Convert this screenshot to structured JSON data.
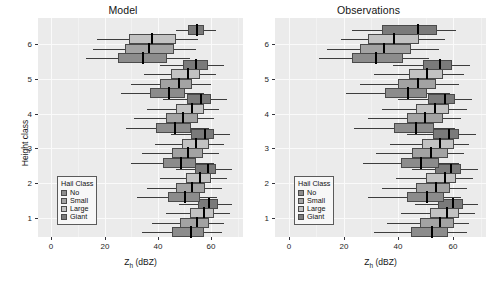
{
  "chart_data": {
    "type": "box",
    "title": "",
    "panels": [
      {
        "label": "Model",
        "key": "model"
      },
      {
        "label": "Observations",
        "key": "observations"
      }
    ],
    "xlabel": "Z_h (dBZ)",
    "xlabel_base": "Z",
    "xlabel_sub": "h",
    "xlabel_unit": " (dBZ)",
    "ylabel": "Height class",
    "xlim": [
      -5,
      72
    ],
    "xticks": [
      0,
      20,
      40,
      60
    ],
    "xtick_labels": [
      "0",
      "20",
      "40",
      "60"
    ],
    "yticks": [
      1,
      2,
      3,
      4,
      5,
      6
    ],
    "ytick_labels": [
      "1",
      "2",
      "3",
      "4",
      "5",
      "6"
    ],
    "ylim": [
      0.45,
      6.75
    ],
    "grid": true,
    "legend": {
      "title": "Hail Class",
      "position": "lower-left-inside",
      "entries": [
        {
          "label": "No",
          "color": "#8c8c8c"
        },
        {
          "label": "Small",
          "color": "#a3a3a3"
        },
        {
          "label": "Large",
          "color": "#c2c2c2"
        },
        {
          "label": "Giant",
          "color": "#7a7a7a"
        }
      ]
    },
    "series_order": [
      "No",
      "Small",
      "Large",
      "Giant"
    ],
    "boxes": {
      "model": [
        {
          "height_class": 6,
          "hail_class": "Giant",
          "whisker_low": 47.0,
          "q1": 51.5,
          "median": 54.5,
          "q3": 57.5,
          "whisker_high": 62.0
        },
        {
          "height_class": 6,
          "hail_class": "Large",
          "whisker_low": 17.0,
          "q1": 29.0,
          "median": 37.5,
          "q3": 46.5,
          "whisker_high": 55.0
        },
        {
          "height_class": 6,
          "hail_class": "Small",
          "whisker_low": 15.5,
          "q1": 27.5,
          "median": 36.5,
          "q3": 46.0,
          "whisker_high": 54.0
        },
        {
          "height_class": 6,
          "hail_class": "No",
          "whisker_low": 13.0,
          "q1": 25.0,
          "median": 34.0,
          "q3": 43.5,
          "whisker_high": 52.0
        },
        {
          "height_class": 5,
          "hail_class": "Giant",
          "whisker_low": 41.0,
          "q1": 49.5,
          "median": 54.0,
          "q3": 59.0,
          "whisker_high": 65.0
        },
        {
          "height_class": 5,
          "hail_class": "Large",
          "whisker_low": 35.0,
          "q1": 45.0,
          "median": 51.0,
          "q3": 56.0,
          "whisker_high": 62.0
        },
        {
          "height_class": 5,
          "hail_class": "Small",
          "whisker_low": 30.0,
          "q1": 41.0,
          "median": 47.5,
          "q3": 53.0,
          "whisker_high": 60.0
        },
        {
          "height_class": 5,
          "hail_class": "No",
          "whisker_low": 26.0,
          "q1": 37.0,
          "median": 44.0,
          "q3": 50.0,
          "whisker_high": 57.0
        },
        {
          "height_class": 4,
          "hail_class": "Giant",
          "whisker_low": 42.0,
          "q1": 51.0,
          "median": 56.0,
          "q3": 60.0,
          "whisker_high": 66.0
        },
        {
          "height_class": 4,
          "hail_class": "Large",
          "whisker_low": 36.0,
          "q1": 47.0,
          "median": 52.5,
          "q3": 57.5,
          "whisker_high": 63.0
        },
        {
          "height_class": 4,
          "hail_class": "Small",
          "whisker_low": 31.0,
          "q1": 43.0,
          "median": 49.0,
          "q3": 55.0,
          "whisker_high": 61.0
        },
        {
          "height_class": 4,
          "hail_class": "No",
          "whisker_low": 28.0,
          "q1": 39.5,
          "median": 46.0,
          "q3": 52.5,
          "whisker_high": 59.0
        },
        {
          "height_class": 3,
          "hail_class": "Giant",
          "whisker_low": 45.0,
          "q1": 52.5,
          "median": 57.5,
          "q3": 61.0,
          "whisker_high": 67.0
        },
        {
          "height_class": 3,
          "hail_class": "Large",
          "whisker_low": 39.0,
          "q1": 49.0,
          "median": 54.0,
          "q3": 59.0,
          "whisker_high": 65.0
        },
        {
          "height_class": 3,
          "hail_class": "Small",
          "whisker_low": 34.0,
          "q1": 45.5,
          "median": 51.0,
          "q3": 57.0,
          "whisker_high": 63.0
        },
        {
          "height_class": 3,
          "hail_class": "No",
          "whisker_low": 30.0,
          "q1": 42.0,
          "median": 48.5,
          "q3": 54.5,
          "whisker_high": 61.0
        },
        {
          "height_class": 2,
          "hail_class": "Giant",
          "whisker_low": 47.0,
          "q1": 54.0,
          "median": 58.5,
          "q3": 62.0,
          "whisker_high": 68.0
        },
        {
          "height_class": 2,
          "hail_class": "Large",
          "whisker_low": 41.0,
          "q1": 50.5,
          "median": 55.5,
          "q3": 60.0,
          "whisker_high": 66.0
        },
        {
          "height_class": 2,
          "hail_class": "Small",
          "whisker_low": 36.0,
          "q1": 47.0,
          "median": 52.5,
          "q3": 58.0,
          "whisker_high": 64.0
        },
        {
          "height_class": 2,
          "hail_class": "No",
          "whisker_low": 32.0,
          "q1": 44.0,
          "median": 50.0,
          "q3": 56.0,
          "whisker_high": 62.0
        },
        {
          "height_class": 1,
          "hail_class": "Giant",
          "whisker_low": 48.0,
          "q1": 55.0,
          "median": 59.0,
          "q3": 62.5,
          "whisker_high": 68.0
        },
        {
          "height_class": 1,
          "hail_class": "Large",
          "whisker_low": 43.0,
          "q1": 52.0,
          "median": 57.0,
          "q3": 61.0,
          "whisker_high": 67.0
        },
        {
          "height_class": 1,
          "hail_class": "Small",
          "whisker_low": 38.0,
          "q1": 48.5,
          "median": 54.5,
          "q3": 59.5,
          "whisker_high": 65.0
        },
        {
          "height_class": 1,
          "hail_class": "No",
          "whisker_low": 34.0,
          "q1": 45.5,
          "median": 52.0,
          "q3": 57.5,
          "whisker_high": 64.0
        }
      ],
      "observations": [
        {
          "height_class": 6,
          "hail_class": "Giant",
          "whisker_low": 23.0,
          "q1": 34.0,
          "median": 47.0,
          "q3": 54.0,
          "whisker_high": 61.0
        },
        {
          "height_class": 6,
          "hail_class": "Large",
          "whisker_low": 19.0,
          "q1": 29.0,
          "median": 38.0,
          "q3": 47.5,
          "whisker_high": 57.0
        },
        {
          "height_class": 6,
          "hail_class": "Small",
          "whisker_low": 14.0,
          "q1": 26.0,
          "median": 34.5,
          "q3": 44.5,
          "whisker_high": 55.0
        },
        {
          "height_class": 6,
          "hail_class": "No",
          "whisker_low": 11.0,
          "q1": 23.0,
          "median": 31.5,
          "q3": 41.5,
          "whisker_high": 51.0
        },
        {
          "height_class": 5,
          "hail_class": "Giant",
          "whisker_low": 38.0,
          "q1": 49.0,
          "median": 55.0,
          "q3": 59.5,
          "whisker_high": 66.0
        },
        {
          "height_class": 5,
          "hail_class": "Large",
          "whisker_low": 31.0,
          "q1": 44.0,
          "median": 50.0,
          "q3": 56.5,
          "whisker_high": 64.0
        },
        {
          "height_class": 5,
          "hail_class": "Small",
          "whisker_low": 26.0,
          "q1": 40.0,
          "median": 47.0,
          "q3": 54.0,
          "whisker_high": 62.0
        },
        {
          "height_class": 5,
          "hail_class": "No",
          "whisker_low": 21.0,
          "q1": 35.0,
          "median": 43.0,
          "q3": 50.5,
          "whisker_high": 59.0
        },
        {
          "height_class": 4,
          "hail_class": "Giant",
          "whisker_low": 40.0,
          "q1": 51.0,
          "median": 56.5,
          "q3": 61.0,
          "whisker_high": 67.0
        },
        {
          "height_class": 4,
          "hail_class": "Large",
          "whisker_low": 34.0,
          "q1": 46.5,
          "median": 53.0,
          "q3": 58.5,
          "whisker_high": 65.0
        },
        {
          "height_class": 4,
          "hail_class": "Small",
          "whisker_low": 29.0,
          "q1": 43.0,
          "median": 49.5,
          "q3": 56.0,
          "whisker_high": 63.0
        },
        {
          "height_class": 4,
          "hail_class": "No",
          "whisker_low": 24.0,
          "q1": 38.5,
          "median": 46.0,
          "q3": 53.0,
          "whisker_high": 61.0
        },
        {
          "height_class": 3,
          "hail_class": "Giant",
          "whisker_low": 43.0,
          "q1": 52.5,
          "median": 58.0,
          "q3": 62.0,
          "whisker_high": 68.0
        },
        {
          "height_class": 3,
          "hail_class": "Large",
          "whisker_low": 37.0,
          "q1": 48.5,
          "median": 55.0,
          "q3": 60.0,
          "whisker_high": 66.0
        },
        {
          "height_class": 3,
          "hail_class": "Small",
          "whisker_low": 32.0,
          "q1": 45.0,
          "median": 51.5,
          "q3": 58.0,
          "whisker_high": 64.0
        },
        {
          "height_class": 3,
          "hail_class": "No",
          "whisker_low": 27.0,
          "q1": 41.0,
          "median": 48.0,
          "q3": 55.0,
          "whisker_high": 62.0
        },
        {
          "height_class": 2,
          "hail_class": "Giant",
          "whisker_low": 45.0,
          "q1": 53.5,
          "median": 59.0,
          "q3": 63.0,
          "whisker_high": 69.0
        },
        {
          "height_class": 2,
          "hail_class": "Large",
          "whisker_low": 39.0,
          "q1": 50.0,
          "median": 56.5,
          "q3": 61.0,
          "whisker_high": 67.0
        },
        {
          "height_class": 2,
          "hail_class": "Small",
          "whisker_low": 34.0,
          "q1": 46.5,
          "median": 53.5,
          "q3": 59.0,
          "whisker_high": 65.0
        },
        {
          "height_class": 2,
          "hail_class": "No",
          "whisker_low": 29.0,
          "q1": 43.0,
          "median": 50.0,
          "q3": 56.5,
          "whisker_high": 63.0
        },
        {
          "height_class": 1,
          "hail_class": "Giant",
          "whisker_low": 46.0,
          "q1": 54.5,
          "median": 59.5,
          "q3": 63.5,
          "whisker_high": 69.0
        },
        {
          "height_class": 1,
          "hail_class": "Large",
          "whisker_low": 41.0,
          "q1": 51.5,
          "median": 57.5,
          "q3": 62.0,
          "whisker_high": 68.0
        },
        {
          "height_class": 1,
          "hail_class": "Small",
          "whisker_low": 36.0,
          "q1": 48.0,
          "median": 55.0,
          "q3": 60.5,
          "whisker_high": 66.0
        },
        {
          "height_class": 1,
          "hail_class": "No",
          "whisker_low": 31.0,
          "q1": 44.5,
          "median": 52.0,
          "q3": 58.0,
          "whisker_high": 65.0
        }
      ]
    }
  }
}
